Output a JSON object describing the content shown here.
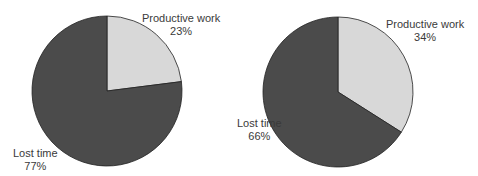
{
  "colors": {
    "lost_time": "#4b4b4b",
    "productive_work": "#d8d8d8",
    "outline": "#222222"
  },
  "chart_data": [
    {
      "type": "pie",
      "title": "",
      "categories": [
        "Productive work",
        "Lost time"
      ],
      "values": [
        23,
        77
      ],
      "labels": [
        {
          "name": "Productive work",
          "pct": "23%"
        },
        {
          "name": "Lost time",
          "pct": "77%"
        }
      ],
      "start_angle_deg": 0,
      "direction": "clockwise"
    },
    {
      "type": "pie",
      "title": "",
      "categories": [
        "Productive work",
        "Lost time"
      ],
      "values": [
        34,
        66
      ],
      "labels": [
        {
          "name": "Productive work",
          "pct": "34%"
        },
        {
          "name": "Lost time",
          "pct": "66%"
        }
      ],
      "start_angle_deg": 0,
      "direction": "clockwise"
    }
  ]
}
